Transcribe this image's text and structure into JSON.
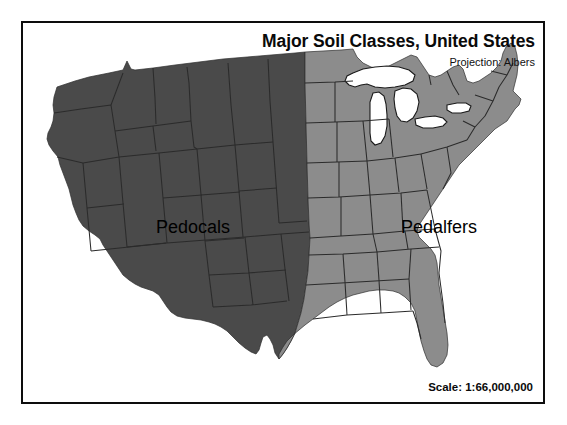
{
  "map": {
    "title": "Major Soil Classes, United States",
    "subtitle": "Projection: Albers",
    "scale": "Scale: 1:66,000,000",
    "regions": [
      {
        "id": "pedocals",
        "label": "Pedocals",
        "color": "#4a4a4a",
        "label_x": 170,
        "label_y": 210,
        "description": "Western United States, dark gray shading"
      },
      {
        "id": "pedalfers",
        "label": "Pedalfers",
        "color": "#8c8c8c",
        "label_x": 416,
        "label_y": 210,
        "description": "Eastern United States, medium gray shading"
      }
    ],
    "water": {
      "id": "great-lakes",
      "label": "Great Lakes",
      "color": "#ffffff"
    },
    "colors": {
      "frame": "#0d0d0d",
      "background": "#ffffff",
      "state_border": "#2b2b2b",
      "coast_outline": "#1a1a1a"
    }
  },
  "chart_data": {
    "type": "map",
    "title": "Major Soil Classes, United States",
    "subtitle": "Projection: Albers",
    "projection": "Albers",
    "scale": "1:66,000,000",
    "legend_position": "in-map labels",
    "categories": [
      "Pedocals",
      "Pedalfers"
    ],
    "series": [
      {
        "name": "Pedocals",
        "value_color": "#4a4a4a",
        "extent": "Western United States (west of approximately 97th meridian), including Washington, Oregon, California, Idaho, Nevada, Montana, Wyoming, Utah, Arizona, Colorado, New Mexico, western Texas, western Dakotas, western Nebraska, western Kansas, western Oklahoma"
      },
      {
        "name": "Pedalfers",
        "value_color": "#8c8c8c",
        "extent": "Eastern United States (east of approximately 97th meridian), including the Midwest, Great Lakes states, Northeast, Appalachia, Southeast, Gulf Coast and eastern Texas"
      }
    ],
    "annotations": [
      {
        "text": "Pedocals",
        "x_frac": 0.29,
        "y_frac": 0.49
      },
      {
        "text": "Pedalfers",
        "x_frac": 0.72,
        "y_frac": 0.49
      }
    ]
  }
}
